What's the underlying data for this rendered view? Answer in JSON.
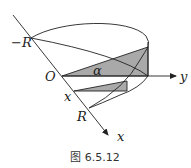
{
  "figure": {
    "caption": "图 6.5.12",
    "labels": {
      "neg_r": "−R",
      "origin": "O",
      "y_axis": "y",
      "alpha": "α",
      "x_point": "x",
      "r_point": "R",
      "x_axis": "x"
    },
    "colors": {
      "stroke": "#222222",
      "shade": "#a9a9a9",
      "background": "#ffffff"
    }
  }
}
